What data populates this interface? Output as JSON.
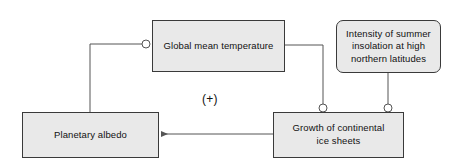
{
  "diagram": {
    "background_color": "#ffffff",
    "node_fill_color": "#e9e9e9",
    "node_border_color": "#3a3a3a",
    "connector_color": "#555555",
    "nodes": {
      "global_mean_temperature": "Global mean temperature",
      "insolation": "Intensity of summer\ninsolation at high\nnorthern latitudes",
      "planetary_albedo": "Planetary albedo",
      "ice_sheets": "Growth of continental\nice sheets"
    },
    "annotations": {
      "feedback_sign": "(+)"
    },
    "junctions": [
      {
        "name": "junction-temperature-left",
        "x": 146,
        "y": 44
      },
      {
        "name": "junction-ice-sheets-temperature",
        "x": 323,
        "y": 108
      },
      {
        "name": "junction-ice-sheets-insolation",
        "x": 388,
        "y": 108
      }
    ]
  }
}
